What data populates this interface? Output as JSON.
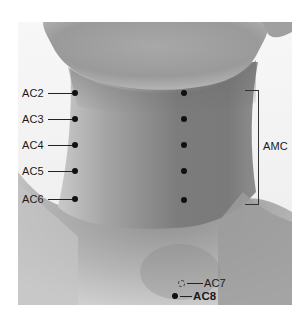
{
  "figure": {
    "colors": {
      "background": "#ffffff",
      "skin_light": "#d9d9d9",
      "skin_mid": "#9a9a9a",
      "skin_dark": "#6f6f6f",
      "marker": "#111111",
      "text": "#1a1a1a"
    }
  },
  "points_left": [
    {
      "label": "AC2",
      "x": 75,
      "y": 93
    },
    {
      "label": "AC3",
      "x": 75,
      "y": 119
    },
    {
      "label": "AC4",
      "x": 75,
      "y": 145
    },
    {
      "label": "AC5",
      "x": 75,
      "y": 171
    },
    {
      "label": "AC6",
      "x": 75,
      "y": 199
    }
  ],
  "points_right": [
    {
      "x": 184,
      "y": 93
    },
    {
      "x": 184,
      "y": 119
    },
    {
      "x": 184,
      "y": 145
    },
    {
      "x": 184,
      "y": 171
    },
    {
      "x": 184,
      "y": 200
    }
  ],
  "bracket": {
    "label": "AMC",
    "top": 90,
    "bottom": 203
  },
  "points_bottom": [
    {
      "label": "AC7",
      "style": "hollow-dashed",
      "x": 181,
      "y": 283
    },
    {
      "label": "AC8",
      "style": "filled-bold",
      "x": 175,
      "y": 296
    }
  ]
}
